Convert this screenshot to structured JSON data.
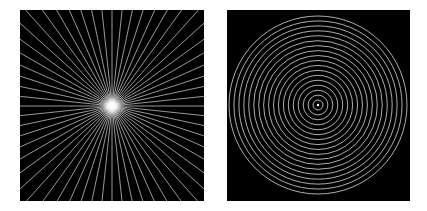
{
  "figure": {
    "background": "#ffffff",
    "panels": [
      {
        "id": "left",
        "label": "Radial starburst pattern",
        "pattern": "radial-lines",
        "background": "#000000",
        "line_color": "#d9d9d9",
        "center_glow_color": "#ffffff",
        "line_count": 60,
        "center": [
          92,
          96
        ],
        "size": [
          184,
          191
        ]
      },
      {
        "id": "right",
        "label": "Concentric circles pattern",
        "pattern": "concentric-circles",
        "background": "#000000",
        "line_color": "#d9d9d9",
        "ring_count": 18,
        "max_radius": 89,
        "center": [
          91,
          95
        ],
        "size": [
          183,
          191
        ]
      }
    ]
  }
}
